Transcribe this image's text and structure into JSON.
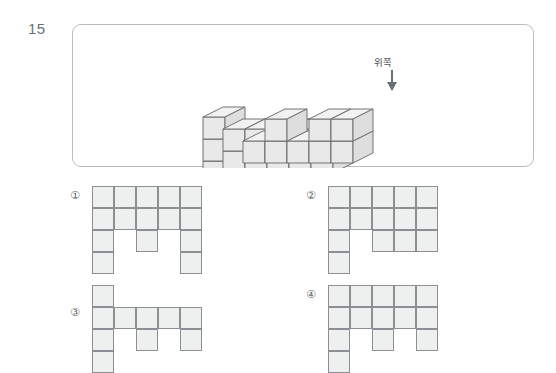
{
  "question": {
    "number": "15",
    "figure_label": "위쪽",
    "arrow_direction": "down"
  },
  "colors": {
    "panel_border": "#b9bdc1",
    "cell_fill": "#eeefef",
    "cell_border": "#8c9095",
    "cube_top": "#f2f2f2",
    "cube_front": "#e9e9e9",
    "cube_side": "#dedede",
    "cube_outline": "#6e7276",
    "text": "#555a5e",
    "arrow": "#6a6f73"
  },
  "solid": {
    "description": "isometric stack of unit cubes viewed from upper-left",
    "cube_size": 22,
    "iso_dx": 20,
    "iso_dy": 10,
    "rows": 3,
    "cols": 5,
    "heights": [
      [
        3,
        2,
        2,
        2,
        2
      ],
      [
        2,
        2,
        2,
        2,
        2
      ],
      [
        1,
        2,
        1,
        2,
        2
      ]
    ]
  },
  "options": [
    {
      "id": "option-1",
      "label": "①",
      "columns": 5,
      "rows": 4,
      "cells": [
        [
          1,
          1,
          1,
          1,
          1
        ],
        [
          1,
          1,
          1,
          1,
          1
        ],
        [
          1,
          0,
          1,
          0,
          1
        ],
        [
          1,
          0,
          0,
          0,
          1
        ]
      ]
    },
    {
      "id": "option-2",
      "label": "②",
      "columns": 5,
      "rows": 4,
      "cells": [
        [
          1,
          1,
          1,
          1,
          1
        ],
        [
          1,
          1,
          1,
          1,
          1
        ],
        [
          1,
          0,
          1,
          1,
          1
        ],
        [
          1,
          0,
          0,
          0,
          0
        ]
      ]
    },
    {
      "id": "option-3",
      "label": "③",
      "columns": 5,
      "rows": 4,
      "cells": [
        [
          1,
          0,
          0,
          0,
          0
        ],
        [
          1,
          1,
          1,
          1,
          1
        ],
        [
          1,
          0,
          1,
          0,
          1
        ],
        [
          1,
          0,
          0,
          0,
          0
        ]
      ]
    },
    {
      "id": "option-4",
      "label": "④",
      "columns": 5,
      "rows": 4,
      "cells": [
        [
          1,
          1,
          1,
          1,
          1
        ],
        [
          1,
          1,
          1,
          1,
          1
        ],
        [
          1,
          0,
          1,
          0,
          1
        ],
        [
          1,
          0,
          0,
          0,
          0
        ]
      ]
    }
  ]
}
